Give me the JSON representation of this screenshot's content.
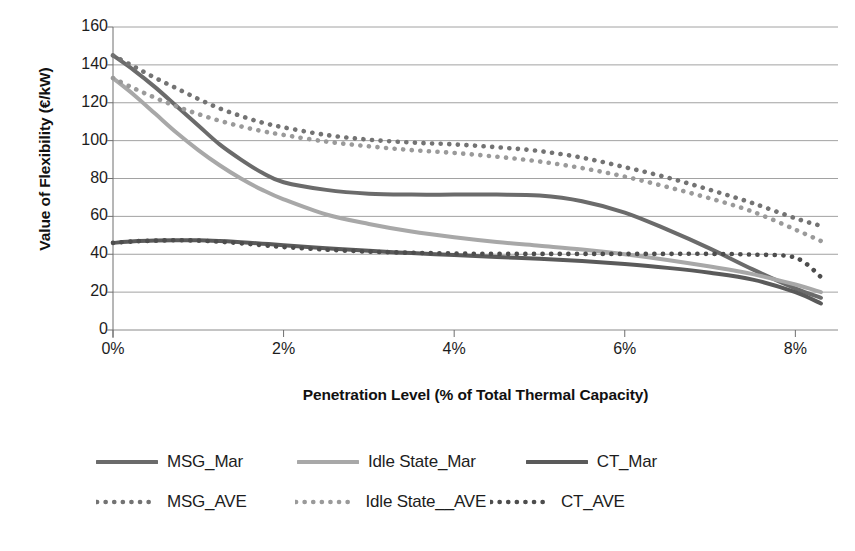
{
  "chart_data": {
    "type": "line",
    "title": "",
    "xlabel": "Penetration Level (% of Total Thermal Capacity)",
    "ylabel": "Value of Flexibility (€/kW)",
    "xlim": [
      0,
      8.5
    ],
    "ylim": [
      0,
      160
    ],
    "grid": true,
    "legend_position": "bottom",
    "xticks": [
      "0%",
      "2%",
      "4%",
      "6%",
      "8%"
    ],
    "xtick_values": [
      0,
      2,
      4,
      6,
      8
    ],
    "yticks": [
      "0",
      "20",
      "40",
      "60",
      "80",
      "100",
      "120",
      "140",
      "160"
    ],
    "ytick_values": [
      0,
      20,
      40,
      60,
      80,
      100,
      120,
      140,
      160
    ],
    "x": [
      0,
      0.25,
      0.5,
      0.75,
      1,
      1.25,
      1.5,
      1.75,
      2,
      2.5,
      3,
      3.5,
      4,
      4.5,
      5,
      5.5,
      6,
      6.5,
      7,
      7.5,
      8,
      8.3
    ],
    "series": [
      {
        "name": "MSG_Mar",
        "style": "solid",
        "color": "#6b6b6b",
        "values": [
          145,
          137,
          128,
          118,
          108,
          98,
          90,
          83,
          78,
          74,
          72,
          71.5,
          71.5,
          71.5,
          71,
          68,
          62,
          53,
          43,
          32,
          22,
          17
        ]
      },
      {
        "name": "Idle State_Mar",
        "style": "solid",
        "color": "#a8a8a8",
        "values": [
          133,
          124,
          114,
          104,
          95,
          87,
          80,
          74,
          69,
          61,
          56,
          52,
          49,
          46.5,
          44.5,
          42.5,
          40,
          37,
          33.5,
          29.5,
          24,
          20
        ]
      },
      {
        "name": "CT_Mar",
        "style": "solid",
        "color": "#5a5a5a",
        "values": [
          46,
          46.8,
          47.2,
          47.4,
          47.4,
          47,
          46.4,
          45.6,
          44.8,
          43.2,
          41.8,
          40.6,
          39.6,
          38.6,
          37.6,
          36.4,
          34.8,
          32.8,
          30.2,
          26.6,
          20,
          14
        ]
      },
      {
        "name": "MSG_AVE",
        "style": "dotted",
        "color": "#737373",
        "values": [
          145,
          139,
          133,
          127.5,
          122,
          117,
          113,
          109.5,
          107,
          103,
          100.5,
          99,
          98,
          96.5,
          94.5,
          91,
          86,
          80.5,
          74,
          67,
          59,
          55
        ]
      },
      {
        "name": "Idle State__AVE",
        "style": "dotted",
        "color": "#9a9a9a",
        "values": [
          133,
          127.5,
          122.5,
          118,
          114,
          110.5,
          107.5,
          105,
          103,
          99.5,
          97,
          95,
          93.5,
          91.5,
          89,
          85.5,
          81,
          75.5,
          69.5,
          62.5,
          53,
          47
        ]
      },
      {
        "name": "CT_AVE",
        "style": "dotted",
        "color": "#4d4d4d",
        "values": [
          46,
          46.8,
          47.2,
          47.4,
          47.2,
          46.6,
          45.8,
          44.8,
          43.8,
          42.4,
          41.4,
          40.8,
          40.4,
          40.2,
          40.2,
          40.2,
          40.2,
          40.2,
          40.2,
          39.8,
          38.2,
          28
        ]
      }
    ]
  },
  "axes": {
    "y_title": "Value of Flexibility (€/kW)",
    "x_title": "Penetration Level (% of Total Thermal Capacity)"
  },
  "legend": {
    "solid_row": [
      {
        "label": "MSG_Mar",
        "color": "#6b6b6b",
        "style": "solid"
      },
      {
        "label": "Idle State_Mar",
        "color": "#a8a8a8",
        "style": "solid"
      },
      {
        "label": "CT_Mar",
        "color": "#5a5a5a",
        "style": "solid"
      }
    ],
    "dotted_row": [
      {
        "label": "MSG_AVE",
        "color": "#737373",
        "style": "dotted"
      },
      {
        "label": "Idle State__AVE",
        "color": "#9a9a9a",
        "style": "dotted"
      },
      {
        "label": "CT_AVE",
        "color": "#4d4d4d",
        "style": "dotted"
      }
    ]
  }
}
